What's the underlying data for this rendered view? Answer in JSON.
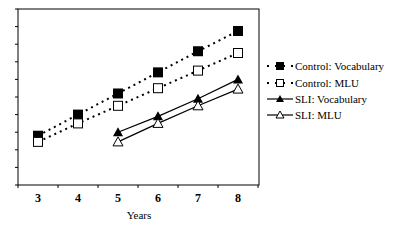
{
  "chart_data": {
    "type": "line",
    "title": "",
    "xlabel": "Years",
    "ylabel": "",
    "categories": [
      "3",
      "4",
      "5",
      "6",
      "7",
      "8"
    ],
    "y_ticks_labeled": false,
    "y_tick_count": 10,
    "ylim": [
      0,
      10
    ],
    "grid": false,
    "legend_position": "right",
    "series": [
      {
        "name": "Control: Vocabulary",
        "marker": "filled-square",
        "line": "dotted",
        "values": [
          2.8,
          4.0,
          5.2,
          6.4,
          7.6,
          8.75
        ]
      },
      {
        "name": "Control: MLU",
        "marker": "open-square",
        "line": "dotted",
        "values": [
          2.45,
          3.5,
          4.5,
          5.5,
          6.5,
          7.5
        ]
      },
      {
        "name": "SLI: Vocabulary",
        "marker": "filled-triangle",
        "line": "solid",
        "values": [
          null,
          null,
          3.0,
          3.9,
          4.9,
          6.0
        ]
      },
      {
        "name": "SLI: MLU",
        "marker": "open-triangle",
        "line": "solid",
        "values": [
          null,
          null,
          2.45,
          3.5,
          4.5,
          5.45
        ]
      }
    ]
  },
  "colors": {
    "ink": "#000000",
    "frame": "#000000",
    "background": "#ffffff"
  }
}
